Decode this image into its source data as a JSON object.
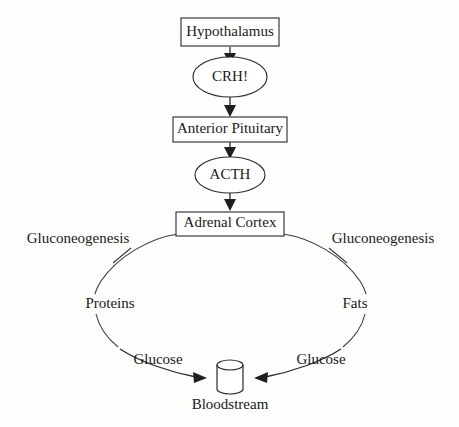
{
  "diagram": {
    "title_visible": false,
    "background_color": "#fdfdfc",
    "line_color": "#2b2b2b",
    "text_color": "#1a1a1a",
    "nodes": {
      "hypothalamus": {
        "label": "Hypothalamus",
        "shape": "rectangle"
      },
      "crh": {
        "label": "CRH!",
        "shape": "ellipse"
      },
      "anterior_pituitary": {
        "label": "Anterior Pituitary",
        "shape": "rectangle"
      },
      "acth": {
        "label": "ACTH",
        "shape": "ellipse"
      },
      "adrenal_cortex": {
        "label": "Adrenal Cortex",
        "shape": "rectangle"
      },
      "bloodstream": {
        "label": "Bloodstream",
        "shape": "cylinder"
      }
    },
    "pathway_labels": {
      "gluconeogenesis_left": "Gluconeogenesis",
      "gluconeogenesis_right": "Gluconeogenesis",
      "proteins": "Proteins",
      "fats": "Fats",
      "glucose_left": "Glucose",
      "glucose_right": "Glucose"
    },
    "flow_sequence": [
      "Hypothalamus",
      "CRH!",
      "Anterior Pituitary",
      "ACTH",
      "Adrenal Cortex"
    ],
    "branches": [
      {
        "side": "left",
        "process": "Gluconeogenesis",
        "substrate": "Proteins",
        "product": "Glucose",
        "destination": "Bloodstream"
      },
      {
        "side": "right",
        "process": "Gluconeogenesis",
        "substrate": "Fats",
        "product": "Glucose",
        "destination": "Bloodstream"
      }
    ]
  }
}
